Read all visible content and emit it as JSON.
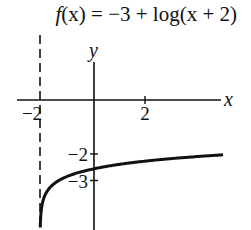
{
  "chart_data": {
    "type": "line",
    "title": "f(x) = −3 + log(x + 2)",
    "title_parts": {
      "fn": "f",
      "rest": "(x) = −3 + log(x + 2)"
    },
    "xlabel": "x",
    "ylabel": "y",
    "x_ticks": [
      {
        "value": -2,
        "label": "−2"
      },
      {
        "value": 2,
        "label": "2"
      }
    ],
    "y_ticks": [
      {
        "value": -2,
        "label": "−2"
      },
      {
        "value": -3,
        "label": "−3"
      }
    ],
    "asymptote": {
      "type": "vertical",
      "x": -2,
      "style": "dashed"
    },
    "function": "-3 + log10(x + 2)",
    "domain_plotted": [
      -1.99,
      5.06
    ],
    "sample_points": [
      {
        "x": -1.99,
        "y": -5.0
      },
      {
        "x": -1.9,
        "y": -4.0
      },
      {
        "x": -1.5,
        "y": -3.3
      },
      {
        "x": -1,
        "y": -3.0
      },
      {
        "x": 0,
        "y": -2.7
      },
      {
        "x": 1,
        "y": -2.52
      },
      {
        "x": 2,
        "y": -2.4
      },
      {
        "x": 3,
        "y": -2.3
      },
      {
        "x": 5,
        "y": -2.15
      }
    ],
    "xlim": [
      -3.0,
      5.3
    ],
    "ylim": [
      -5.1,
      2.0
    ],
    "grid": false,
    "legend": null
  },
  "layout": {
    "origin_px": [
      94,
      100
    ],
    "unit_px": 25.5,
    "line_color": "#111111"
  }
}
